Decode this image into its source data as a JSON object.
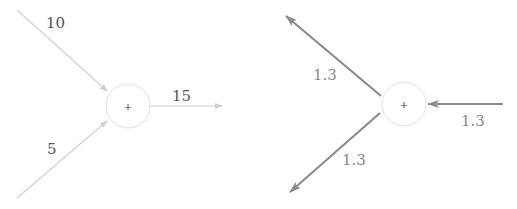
{
  "colors": {
    "forward_edge": "#d0d0d0",
    "backward_edge": "#8c8c8c",
    "node_stroke": "#e0e0e0",
    "label_dark": "#555555",
    "label_light": "#8a8a8a"
  },
  "forward_pass": {
    "node": {
      "operator": "+"
    },
    "inputs": [
      {
        "name": "input-top",
        "value": "10"
      },
      {
        "name": "input-bottom",
        "value": "5"
      }
    ],
    "output": {
      "value": "15"
    }
  },
  "backward_pass": {
    "node": {
      "operator": "+"
    },
    "upstream_gradient": {
      "value": "1.3"
    },
    "downstream_gradients": [
      {
        "name": "grad-top",
        "value": "1.3"
      },
      {
        "name": "grad-bottom",
        "value": "1.3"
      }
    ]
  }
}
